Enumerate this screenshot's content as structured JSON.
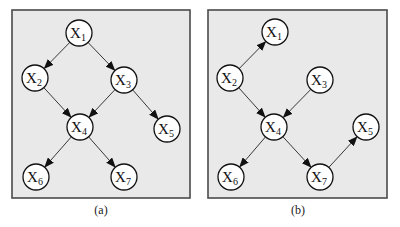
{
  "figure": {
    "panels": [
      {
        "id": "a",
        "caption": "(a)",
        "box": {
          "x": 12,
          "y": 10,
          "w": 178,
          "h": 188
        },
        "caption_pos": {
          "x": 101,
          "y": 214
        },
        "nodes": [
          {
            "id": "X1",
            "base": "X",
            "sub": "1",
            "x": 79,
            "y": 33
          },
          {
            "id": "X2",
            "base": "X",
            "sub": "2",
            "x": 35,
            "y": 78
          },
          {
            "id": "X3",
            "base": "X",
            "sub": "3",
            "x": 124,
            "y": 80
          },
          {
            "id": "X4",
            "base": "X",
            "sub": "4",
            "x": 80,
            "y": 127
          },
          {
            "id": "X5",
            "base": "X",
            "sub": "5",
            "x": 167,
            "y": 129
          },
          {
            "id": "X6",
            "base": "X",
            "sub": "6",
            "x": 36,
            "y": 177
          },
          {
            "id": "X7",
            "base": "X",
            "sub": "7",
            "x": 124,
            "y": 177
          }
        ],
        "edges": [
          {
            "from": "X1",
            "to": "X2"
          },
          {
            "from": "X1",
            "to": "X3"
          },
          {
            "from": "X2",
            "to": "X4"
          },
          {
            "from": "X3",
            "to": "X4"
          },
          {
            "from": "X3",
            "to": "X5"
          },
          {
            "from": "X4",
            "to": "X6"
          },
          {
            "from": "X4",
            "to": "X7"
          }
        ]
      },
      {
        "id": "b",
        "caption": "(b)",
        "box": {
          "x": 208,
          "y": 10,
          "w": 179,
          "h": 188
        },
        "caption_pos": {
          "x": 298,
          "y": 214
        },
        "nodes": [
          {
            "id": "X1",
            "base": "X",
            "sub": "1",
            "x": 275,
            "y": 32
          },
          {
            "id": "X2",
            "base": "X",
            "sub": "2",
            "x": 230,
            "y": 78
          },
          {
            "id": "X3",
            "base": "X",
            "sub": "3",
            "x": 320,
            "y": 80
          },
          {
            "id": "X4",
            "base": "X",
            "sub": "4",
            "x": 274,
            "y": 127
          },
          {
            "id": "X5",
            "base": "X",
            "sub": "5",
            "x": 366,
            "y": 127
          },
          {
            "id": "X6",
            "base": "X",
            "sub": "6",
            "x": 231,
            "y": 177
          },
          {
            "id": "X7",
            "base": "X",
            "sub": "7",
            "x": 320,
            "y": 177
          }
        ],
        "edges": [
          {
            "from": "X2",
            "to": "X1"
          },
          {
            "from": "X2",
            "to": "X4"
          },
          {
            "from": "X3",
            "to": "X4"
          },
          {
            "from": "X4",
            "to": "X6"
          },
          {
            "from": "X4",
            "to": "X7"
          },
          {
            "from": "X7",
            "to": "X5"
          }
        ]
      }
    ],
    "node_radius": 13,
    "colors": {
      "panel_fill": "#e9e9e9",
      "panel_border": "#4a4a4a",
      "node_fill": "#ffffff",
      "edge": "#222222"
    }
  }
}
